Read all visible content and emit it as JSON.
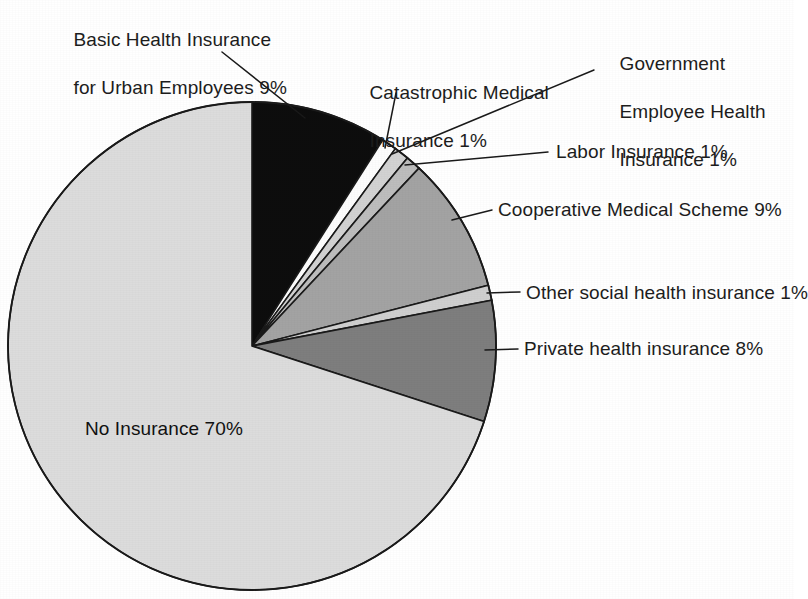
{
  "chart_data": {
    "type": "pie",
    "title": "",
    "subtitle": "",
    "xlabel": "",
    "ylabel": "",
    "legend_position": "none",
    "grid": false,
    "labels_show_percent": true,
    "units": "percent",
    "start_angle_deg": 0,
    "direction": "clockwise",
    "categories": [
      "Basic Health Insurance for Urban Employees",
      "Catastrophic Medical Insurance",
      "Government Employee Health Insurance",
      "Labor Insurance",
      "Cooperative Medical Scheme",
      "Other social health insurance",
      "Private health insurance",
      "No Insurance"
    ],
    "values": [
      9,
      1,
      1,
      1,
      9,
      1,
      8,
      70
    ],
    "colors": [
      "#0d0d0d",
      "#fdfdfd",
      "#d2d2d2",
      "#bdbdbd",
      "#a3a3a3",
      "#cfcfcf",
      "#7e7e7e",
      "#dcdcdc"
    ],
    "slice_label_texts": [
      "Basic Health Insurance for Urban Employees 9%",
      "Catastrophic Medical Insurance 1%",
      "Government Employee Health Insurance 1%",
      "Labor Insurance 1%",
      "Cooperative Medical Scheme 9%",
      "Other social health insurance 1%",
      "Private health insurance 8%",
      "No Insurance 70%"
    ]
  },
  "labels": {
    "basic_health_line1": "Basic Health Insurance",
    "basic_health_line2": "for Urban Employees 9%",
    "catastrophic_line1": "Catastrophic Medical",
    "catastrophic_line2": "Insurance 1%",
    "government_line1": "Government",
    "government_line2": "Employee Health",
    "government_line3": "Insurance 1%",
    "labor": "Labor Insurance 1%",
    "cooperative": "Cooperative Medical Scheme 9%",
    "other_social": "Other social health insurance 1%",
    "private": "Private health insurance 8%",
    "no_insurance": "No Insurance 70%"
  },
  "palette": {
    "background": "#ffffff",
    "outline": "#1a1a1a",
    "text": "#1d1d1d",
    "no_insurance": "#dcdcdc",
    "basic_health": "#0d0d0d",
    "catastrophic": "#fdfdfd",
    "government": "#d2d2d2",
    "labor": "#bdbdbd",
    "cooperative": "#a3a3a3",
    "other_social": "#cfcfcf",
    "private": "#7e7e7e"
  }
}
